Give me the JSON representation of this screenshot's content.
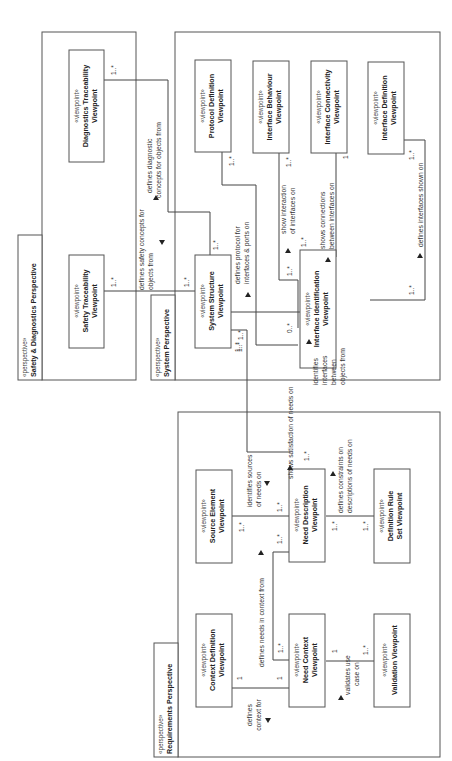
{
  "perspectives": [
    {
      "id": "safety",
      "stereotype": "«perspective»",
      "name": "Safety & Diagnostics Perspective"
    },
    {
      "id": "system",
      "stereotype": "«perspective»",
      "name": "System Perspective"
    },
    {
      "id": "requirements",
      "stereotype": "«perspective»",
      "name": "Requirements Perspective"
    }
  ],
  "viewpoints": {
    "diagnostics_traceability": {
      "stereotype": "«viewpoint»",
      "line1": "Diagnostics Traceability",
      "line2": "Viewpoint"
    },
    "safety_traceability": {
      "stereotype": "«viewpoint»",
      "line1": "Safety Traceability",
      "line2": "Viewpoint"
    },
    "protocol_definition": {
      "stereotype": "«viewpoint»",
      "line1": "Protocol Definition",
      "line2": "Viewpoint"
    },
    "interface_behaviour": {
      "stereotype": "«viewpoint»",
      "line1": "Interface Behaviour",
      "line2": "Viewpoint"
    },
    "interface_connectivity": {
      "stereotype": "«viewpoint»",
      "line1": "Interface Connectivity",
      "line2": "Viewpoint"
    },
    "interface_definition": {
      "stereotype": "«viewpoint»",
      "line1": "Interface Definition",
      "line2": "Viewpoint"
    },
    "system_structure": {
      "stereotype": "«viewpoint»",
      "line1": "System Structure",
      "line2": "Viewpoint"
    },
    "interface_identification": {
      "stereotype": "«viewpoint»",
      "line1": "Interface Identification",
      "line2": "Viewpoint"
    },
    "source_element": {
      "stereotype": "«viewpoint»",
      "line1": "Source Element",
      "line2": "Viewpoint"
    },
    "need_description": {
      "stereotype": "«viewpoint»",
      "line1": "Need Description",
      "line2": "Viewpoint"
    },
    "definition_rule_set": {
      "stereotype": "«viewpoint»",
      "line1": "Definition Rule",
      "line2": "Set Viewpoint"
    },
    "context_definition": {
      "stereotype": "«viewpoint»",
      "line1": "Context Definition",
      "line2": "Viewpoint"
    },
    "need_context": {
      "stereotype": "«viewpoint»",
      "line1": "Need Context",
      "line2": "Viewpoint"
    },
    "validation": {
      "stereotype": "«viewpoint»",
      "line1": "Validation Viewpoint",
      "line2": ""
    }
  },
  "relationships": {
    "diag_defines": {
      "l1": "defines diagnostic",
      "l2": "concepts for objects from",
      "m_src": "1..*",
      "m_dst": "1..*"
    },
    "safety_defines": {
      "l1": "defines safety concepts for",
      "l2": "objects from",
      "m_src": "1..*",
      "m_dst": "1..*"
    },
    "protocol_defines": {
      "l1": "defines protocol for",
      "l2": "interfaces & ports on",
      "m_src": "1..*",
      "m_dst": "1..*"
    },
    "behaviour_shows": {
      "l1": "show interaction",
      "l2": "of interfaces on",
      "m_src": "1..*",
      "m_dst": "1..*"
    },
    "connectivity_shows": {
      "l1": "shows connections",
      "l2": "between interfaces on",
      "m_src": "1",
      "m_dst": "1..*"
    },
    "interface_def_defines": {
      "l1": "defines interfaces shown on",
      "m_src": "1..*",
      "m_dst": "1..*"
    },
    "identifies_interfaces": {
      "l1": "identifies",
      "l2": "interfaces",
      "l3": "between",
      "l4": "objects from",
      "m_src": "0..*",
      "m_dst": "1..*"
    },
    "shows_satisfaction": {
      "l1": "shows satisfaction of needs on",
      "m_src": "1..*",
      "m_dst": "1..*"
    },
    "identifies_sources": {
      "l1": "identifies sources",
      "l2": "of needs on",
      "m_src": "1..*",
      "m_dst": "1..*"
    },
    "defines_constraints": {
      "l1": "defines constraints on",
      "l2": "descriptions of needs on",
      "m_src": "1..*",
      "m_dst": "1..*"
    },
    "defines_needs_context": {
      "l1": "defines needs in context from",
      "m_src": "1..*",
      "m_dst": "1..*"
    },
    "defines_context": {
      "l1": "defines",
      "l2": "context for",
      "m_src": "1",
      "m_dst": "1"
    },
    "validates_use_case": {
      "l1": "validates use",
      "l2": "case on",
      "m_src": "1..*",
      "m_dst": "1"
    }
  }
}
